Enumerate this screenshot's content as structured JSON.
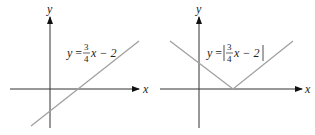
{
  "graphs": [
    {
      "id": "left",
      "axis_x_label": "x",
      "axis_y_label": "y",
      "equation": {
        "lhs": "y",
        "eq": "=",
        "frac_num": "3",
        "frac_den": "4",
        "rest": "x − 2"
      },
      "curve_color": "#a0a0a0"
    },
    {
      "id": "right",
      "axis_x_label": "x",
      "axis_y_label": "y",
      "equation": {
        "lhs": "y",
        "eq": "=",
        "frac_num": "3",
        "frac_den": "4",
        "rest": "x − 2"
      },
      "curve_color": "#a0a0a0"
    }
  ]
}
